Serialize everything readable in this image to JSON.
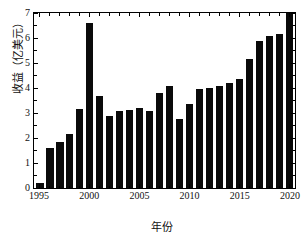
{
  "chart_data": {
    "type": "bar",
    "title": "",
    "xlabel": "年份",
    "ylabel": "收益（亿美元）",
    "categories": [
      1995,
      1996,
      1997,
      1998,
      1999,
      2000,
      2001,
      2002,
      2003,
      2004,
      2005,
      2006,
      2007,
      2008,
      2009,
      2010,
      2011,
      2012,
      2013,
      2014,
      2015,
      2016,
      2017,
      2018,
      2019,
      2020
    ],
    "values": [
      0.22,
      1.62,
      1.83,
      2.15,
      3.17,
      6.6,
      3.7,
      2.89,
      3.09,
      3.13,
      3.22,
      3.1,
      3.79,
      4.09,
      2.75,
      3.38,
      3.95,
      4.0,
      4.09,
      4.21,
      4.36,
      5.18,
      5.89,
      6.09,
      6.16,
      7.0
    ],
    "xlim": [
      1994.5,
      2020.5
    ],
    "ylim": [
      0,
      7
    ],
    "ytick_labels": [
      "0",
      "1",
      "2",
      "3",
      "4",
      "5",
      "6",
      "7"
    ],
    "ytick_values": [
      0,
      1,
      2,
      3,
      4,
      5,
      6,
      7
    ],
    "ytick_minor_values": [
      0.5,
      1.5,
      2.5,
      3.5,
      4.5,
      5.5,
      6.5
    ],
    "xtick_labels": [
      "1995",
      "2000",
      "2005",
      "2010",
      "2015",
      "2020"
    ],
    "xtick_values": [
      1995,
      2000,
      2005,
      2010,
      2015,
      2020
    ],
    "grid": false,
    "legend": null,
    "bar_color": "#0a0a0a",
    "axis_color": "#000000",
    "background_color": "#ffffff"
  }
}
